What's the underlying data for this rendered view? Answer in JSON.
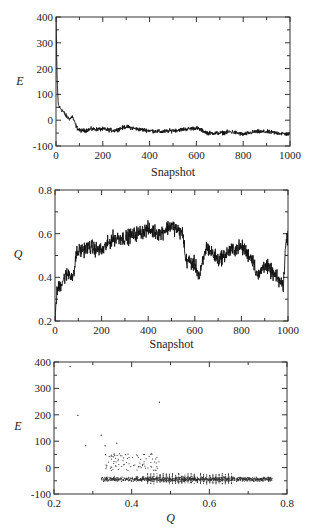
{
  "chart_data": [
    {
      "type": "line",
      "title": "",
      "xlabel": "Snapshot",
      "ylabel": "E",
      "xlim": [
        0,
        1000
      ],
      "ylim": [
        -100,
        400
      ],
      "xticks": [
        0,
        200,
        400,
        600,
        800,
        1000
      ],
      "yticks": [
        -100,
        0,
        100,
        200,
        300,
        400
      ],
      "xtick_labels": [
        "0",
        "200",
        "400",
        "600",
        "800",
        "1000"
      ],
      "ytick_labels": [
        "-100",
        "0",
        "100",
        "200",
        "300",
        "400"
      ],
      "grid": false,
      "legend": null,
      "series": [
        {
          "name": "E",
          "x": [
            0,
            5,
            10,
            15,
            20,
            30,
            40,
            50,
            60,
            70,
            80,
            90,
            100,
            120,
            150,
            200,
            250,
            300,
            350,
            400,
            450,
            500,
            550,
            600,
            650,
            700,
            750,
            800,
            850,
            900,
            950,
            1000
          ],
          "values": [
            400,
            150,
            60,
            50,
            45,
            35,
            20,
            10,
            5,
            15,
            -10,
            -30,
            -40,
            -40,
            -35,
            -35,
            -40,
            -25,
            -35,
            -40,
            -45,
            -40,
            -35,
            -30,
            -50,
            -50,
            -45,
            -55,
            -45,
            -45,
            -50,
            -55
          ]
        }
      ]
    },
    {
      "type": "line",
      "title": "",
      "xlabel": "Snapshot",
      "ylabel": "Q",
      "xlim": [
        0,
        1000
      ],
      "ylim": [
        0.2,
        0.8
      ],
      "xticks": [
        0,
        200,
        400,
        600,
        800,
        1000
      ],
      "yticks": [
        0.2,
        0.4,
        0.6,
        0.8
      ],
      "xtick_labels": [
        "0",
        "200",
        "400",
        "600",
        "800",
        "1000"
      ],
      "ytick_labels": [
        "0.2",
        "0.4",
        "0.6",
        "0.8"
      ],
      "grid": false,
      "legend": null,
      "series": [
        {
          "name": "Q",
          "x": [
            0,
            5,
            10,
            20,
            40,
            60,
            80,
            90,
            100,
            150,
            200,
            250,
            300,
            350,
            400,
            450,
            500,
            520,
            550,
            560,
            600,
            620,
            650,
            700,
            750,
            800,
            850,
            870,
            900,
            950,
            980,
            990,
            1000
          ],
          "values": [
            0.2,
            0.3,
            0.34,
            0.36,
            0.4,
            0.42,
            0.4,
            0.5,
            0.52,
            0.54,
            0.52,
            0.58,
            0.58,
            0.6,
            0.62,
            0.6,
            0.64,
            0.62,
            0.6,
            0.48,
            0.46,
            0.4,
            0.54,
            0.48,
            0.52,
            0.54,
            0.48,
            0.4,
            0.46,
            0.4,
            0.36,
            0.55,
            0.6
          ]
        }
      ]
    },
    {
      "type": "scatter",
      "title": "",
      "xlabel": "Q",
      "ylabel": "E",
      "xlim": [
        0.2,
        0.8
      ],
      "ylim": [
        -100,
        400
      ],
      "xticks": [
        0.2,
        0.4,
        0.6,
        0.8
      ],
      "yticks": [
        -100,
        0,
        100,
        200,
        300,
        400
      ],
      "xtick_labels": [
        "0.2",
        "0.4",
        "0.6",
        "0.8"
      ],
      "ytick_labels": [
        "-100",
        "0",
        "100",
        "200",
        "300",
        "400"
      ],
      "grid": false,
      "legend": null,
      "series": [
        {
          "name": "E vs Q",
          "outliers": [
            [
              0.24,
              385
            ],
            [
              0.26,
              200
            ],
            [
              0.47,
              250
            ],
            [
              0.32,
              125
            ],
            [
              0.28,
              85
            ],
            [
              0.33,
              85
            ],
            [
              0.36,
              95
            ]
          ],
          "cluster_note": "dense band at E≈-40 from Q≈0.35 to 0.75; sparser cloud at E 0–60 for Q 0.33–0.46"
        }
      ]
    }
  ]
}
